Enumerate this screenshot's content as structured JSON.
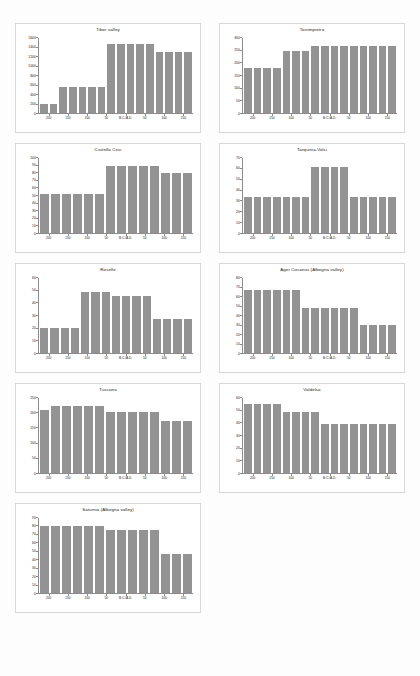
{
  "page": {
    "background": "#fdfdfd",
    "bar_color": "#939393",
    "axis_color": "#8c8c8c",
    "caption": ""
  },
  "chart_data": [
    {
      "type": "bar",
      "title": "Tiber valley",
      "xlabel": "",
      "ylabel": "",
      "ylim": [
        0,
        1600
      ],
      "yticks": [
        0,
        200,
        400,
        600,
        800,
        1000,
        1200,
        1400,
        1600
      ],
      "xticks": [
        "200",
        "150",
        "100",
        "50",
        "B.C./A.D.",
        "50",
        "100",
        "150"
      ],
      "grid": false,
      "legend": "none",
      "categories": [
        "b1",
        "b2",
        "b3",
        "b4",
        "b5",
        "b6",
        "b7",
        "b8",
        "b9",
        "b10",
        "b11",
        "b12",
        "b13",
        "b14",
        "b15",
        "b16"
      ],
      "values": [
        190,
        190,
        560,
        560,
        560,
        560,
        560,
        1470,
        1470,
        1470,
        1470,
        1470,
        1300,
        1300,
        1300,
        1300
      ]
    },
    {
      "type": "bar",
      "title": "Torrimpietra",
      "xlabel": "",
      "ylabel": "",
      "ylim": [
        0,
        300
      ],
      "yticks": [
        0,
        50,
        100,
        150,
        200,
        250,
        300
      ],
      "xticks": [
        "200",
        "150",
        "100",
        "50",
        "B.C./A.D.",
        "50",
        "100",
        "150"
      ],
      "grid": false,
      "legend": "none",
      "categories": [
        "b1",
        "b2",
        "b3",
        "b4",
        "b5",
        "b6",
        "b7",
        "b8",
        "b9",
        "b10",
        "b11",
        "b12",
        "b13",
        "b14",
        "b15",
        "b16"
      ],
      "values": [
        180,
        180,
        180,
        180,
        250,
        250,
        250,
        270,
        270,
        270,
        270,
        270,
        270,
        270,
        270,
        270
      ]
    },
    {
      "type": "bar",
      "title": "Civitella Cesi",
      "xlabel": "",
      "ylabel": "",
      "ylim": [
        0,
        100
      ],
      "yticks": [
        0,
        10,
        20,
        30,
        40,
        50,
        60,
        70,
        80,
        90,
        100
      ],
      "xticks": [
        "200",
        "150",
        "100",
        "50",
        "B.C./A.D.",
        "50",
        "100",
        "150"
      ],
      "grid": false,
      "legend": "none",
      "categories": [
        "b1",
        "b2",
        "b3",
        "b4",
        "b5",
        "b6",
        "b7",
        "b8",
        "b9",
        "b10",
        "b11",
        "b12",
        "b13",
        "b14"
      ],
      "values": [
        52,
        52,
        52,
        52,
        52,
        52,
        90,
        90,
        90,
        90,
        90,
        80,
        80,
        80
      ]
    },
    {
      "type": "bar",
      "title": "Tarquinia-Volci",
      "xlabel": "",
      "ylabel": "",
      "ylim": [
        0,
        70
      ],
      "yticks": [
        0,
        10,
        20,
        30,
        40,
        50,
        60,
        70
      ],
      "xticks": [
        "200",
        "150",
        "100",
        "50",
        "B.C./A.D.",
        "50",
        "100",
        "150"
      ],
      "grid": false,
      "legend": "none",
      "categories": [
        "b1",
        "b2",
        "b3",
        "b4",
        "b5",
        "b6",
        "b7",
        "b8",
        "b9",
        "b10",
        "b11",
        "b12",
        "b13",
        "b14",
        "b15",
        "b16"
      ],
      "values": [
        34,
        34,
        34,
        34,
        34,
        34,
        34,
        62,
        62,
        62,
        62,
        34,
        34,
        34,
        34,
        34
      ]
    },
    {
      "type": "bar",
      "title": "Roselle",
      "xlabel": "",
      "ylabel": "",
      "ylim": [
        0,
        60
      ],
      "yticks": [
        0,
        10,
        20,
        30,
        40,
        50,
        60
      ],
      "xticks": [
        "200",
        "150",
        "100",
        "50",
        "B.C./A.D.",
        "50",
        "100",
        "150"
      ],
      "grid": false,
      "legend": "none",
      "categories": [
        "b1",
        "b2",
        "b3",
        "b4",
        "b5",
        "b6",
        "b7",
        "b8",
        "b9",
        "b10",
        "b11",
        "b12",
        "b13",
        "b14",
        "b15"
      ],
      "values": [
        20,
        20,
        20,
        20,
        49,
        49,
        49,
        46,
        46,
        46,
        46,
        27,
        27,
        27,
        27
      ]
    },
    {
      "type": "bar",
      "title": "Ager Cosanus (Albegna valley)",
      "xlabel": "",
      "ylabel": "",
      "ylim": [
        0,
        80
      ],
      "yticks": [
        0,
        10,
        20,
        30,
        40,
        50,
        60,
        70,
        80
      ],
      "xticks": [
        "200",
        "150",
        "100",
        "50",
        "B.C./A.D.",
        "50",
        "100",
        "150"
      ],
      "grid": false,
      "legend": "none",
      "categories": [
        "b1",
        "b2",
        "b3",
        "b4",
        "b5",
        "b6",
        "b7",
        "b8",
        "b9",
        "b10",
        "b11",
        "b12",
        "b13",
        "b14",
        "b15",
        "b16"
      ],
      "values": [
        67,
        67,
        67,
        67,
        67,
        67,
        48,
        48,
        48,
        48,
        48,
        48,
        30,
        30,
        30,
        30
      ]
    },
    {
      "type": "bar",
      "title": "Tuscana",
      "xlabel": "",
      "ylabel": "",
      "ylim": [
        0,
        250
      ],
      "yticks": [
        0,
        50,
        100,
        150,
        200,
        250
      ],
      "xticks": [
        "200",
        "150",
        "100",
        "50",
        "B.C./A.D.",
        "50",
        "100",
        "150"
      ],
      "grid": false,
      "legend": "none",
      "categories": [
        "b1",
        "b2",
        "b3",
        "b4",
        "b5",
        "b6",
        "b7",
        "b8",
        "b9",
        "b10",
        "b11",
        "b12",
        "b13",
        "b14"
      ],
      "values": [
        210,
        225,
        225,
        225,
        225,
        225,
        202,
        202,
        202,
        202,
        202,
        172,
        172,
        172
      ]
    },
    {
      "type": "bar",
      "title": "Valdelsa",
      "xlabel": "",
      "ylabel": "",
      "ylim": [
        0,
        60
      ],
      "yticks": [
        0,
        10,
        20,
        30,
        40,
        50,
        60
      ],
      "xticks": [
        "200",
        "150",
        "100",
        "50",
        "B.C./A.D.",
        "50",
        "100",
        "150"
      ],
      "grid": false,
      "legend": "none",
      "categories": [
        "b1",
        "b2",
        "b3",
        "b4",
        "b5",
        "b6",
        "b7",
        "b8",
        "b9",
        "b10",
        "b11",
        "b12",
        "b13",
        "b14",
        "b15",
        "b16"
      ],
      "values": [
        55,
        55,
        55,
        55,
        49,
        49,
        49,
        49,
        39,
        39,
        39,
        39,
        39,
        39,
        39,
        39
      ]
    },
    {
      "type": "bar",
      "title": "Saturnia (Albegna valley)",
      "xlabel": "",
      "ylabel": "",
      "ylim": [
        0,
        90
      ],
      "yticks": [
        0,
        10,
        20,
        30,
        40,
        50,
        60,
        70,
        80,
        90
      ],
      "xticks": [
        "200",
        "150",
        "100",
        "50",
        "B.C./A.D.",
        "50",
        "100",
        "150"
      ],
      "grid": false,
      "legend": "none",
      "categories": [
        "b1",
        "b2",
        "b3",
        "b4",
        "b5",
        "b6",
        "b7",
        "b8",
        "b9",
        "b10",
        "b11",
        "b12",
        "b13",
        "b14"
      ],
      "values": [
        80,
        80,
        80,
        80,
        80,
        80,
        76,
        76,
        76,
        76,
        76,
        47,
        47,
        47
      ]
    }
  ]
}
